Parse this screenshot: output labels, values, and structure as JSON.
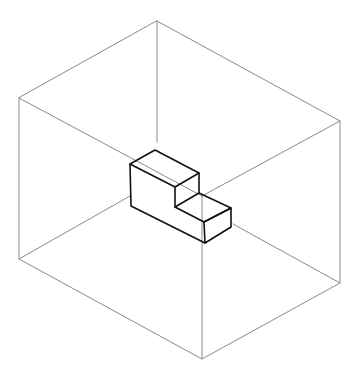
{
  "diagram": {
    "type": "isometric-wireframe",
    "colors": {
      "background": "#ffffff",
      "outer_box": "#8a8a8a",
      "block": "#111111"
    },
    "outer_box": {
      "vertices": {
        "top": [
          157,
          21
        ],
        "left_top": [
          19,
          98
        ],
        "right_top": [
          340,
          121
        ],
        "left_bottom": [
          19,
          259
        ],
        "right_bottom": [
          340,
          283
        ],
        "bottom": [
          202,
          359
        ]
      },
      "inner_segments": [
        [
          [
            157,
            21
          ],
          [
            157,
            142
          ]
        ],
        [
          [
            19,
            98
          ],
          [
            202,
            196
          ]
        ],
        [
          [
            340,
            121
          ],
          [
            202,
            196
          ]
        ],
        [
          [
            202,
            359
          ],
          [
            202,
            196
          ]
        ],
        [
          [
            19,
            259
          ],
          [
            130,
            196
          ]
        ],
        [
          [
            340,
            283
          ],
          [
            233,
            224
          ]
        ]
      ]
    },
    "block": {
      "shape": "L-shaped step",
      "vertices": {
        "top_back": [
          155,
          150
        ],
        "top_left": [
          130,
          164
        ],
        "upper_right": [
          199,
          173
        ],
        "upper_front": [
          175,
          187
        ],
        "step_back_inner": [
          199,
          193
        ],
        "step_front_inner": [
          175,
          207
        ],
        "lower_right_top": [
          231,
          208
        ],
        "lower_front_top": [
          204,
          222
        ],
        "lower_front_bottom": [
          205,
          243
        ],
        "lower_right_bottom": [
          231,
          227
        ],
        "bottom_left": [
          131,
          206
        ]
      }
    }
  }
}
